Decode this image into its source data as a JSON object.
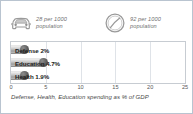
{
  "card": {
    "border_color": "#b9c4d0",
    "background": "#ffffff"
  },
  "stats": [
    {
      "icon": "car-icon",
      "value": "28",
      "unit": "per 1000",
      "text": "28 per 1000\npopulation"
    },
    {
      "icon": "phone-circle-icon",
      "value": "92",
      "unit": "per 1000",
      "text": "92 per 1000\npopulation"
    }
  ],
  "chart_data": {
    "type": "bar",
    "orientation": "horizontal",
    "title": "",
    "caption": "Defense, Health, Education spending as % of GDP",
    "categories": [
      "Defense",
      "Education",
      "Health"
    ],
    "values": [
      2,
      4.7,
      1.9
    ],
    "value_labels": [
      "2%",
      "4.7%",
      "1.9%"
    ],
    "bar_labels": [
      "Defense 2%",
      "Education 4.7%",
      "Health 1.9%"
    ],
    "xlabel": "",
    "ylabel": "",
    "xlim": [
      0,
      25
    ],
    "ticks": [
      "0",
      "5",
      "10",
      "15",
      "20",
      "25"
    ],
    "tick_values": [
      0,
      5,
      10,
      15,
      20,
      25
    ],
    "grid": true,
    "legend": false,
    "bar_color": "#9d9d9d",
    "cap_color": "#3a3a3a",
    "grid_color": "#dfe3e8"
  }
}
